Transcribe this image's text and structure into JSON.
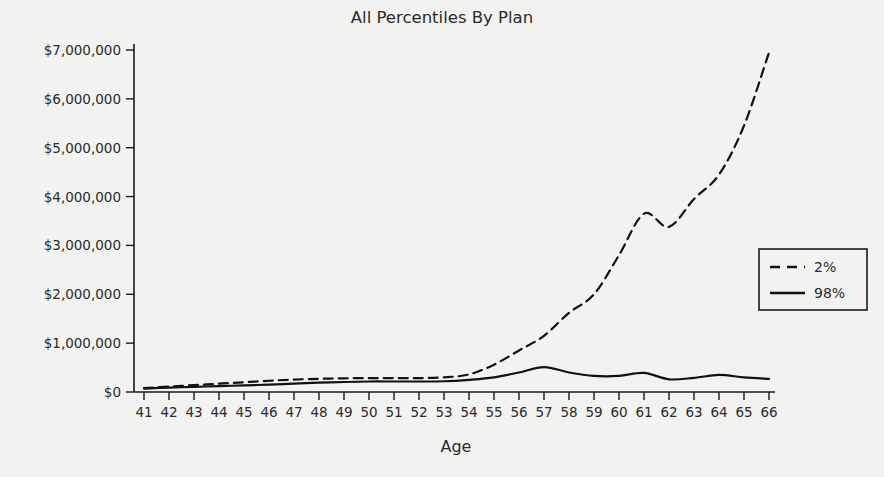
{
  "chart_data": {
    "type": "line",
    "title": "All Percentiles By Plan",
    "xlabel": "Age",
    "ylabel": "",
    "grid": false,
    "legend_position": "right",
    "x": [
      41,
      42,
      43,
      44,
      45,
      46,
      47,
      48,
      49,
      50,
      51,
      52,
      53,
      54,
      55,
      56,
      57,
      58,
      59,
      60,
      61,
      62,
      63,
      64,
      65,
      66
    ],
    "categories": [
      "41",
      "42",
      "43",
      "44",
      "45",
      "46",
      "47",
      "48",
      "49",
      "50",
      "51",
      "52",
      "53",
      "54",
      "55",
      "56",
      "57",
      "58",
      "59",
      "60",
      "61",
      "62",
      "63",
      "64",
      "65",
      "66"
    ],
    "xlim": [
      41,
      66
    ],
    "ylim": [
      0,
      7000000
    ],
    "ytick_values": [
      0,
      1000000,
      2000000,
      3000000,
      4000000,
      5000000,
      6000000,
      7000000
    ],
    "ytick_labels": [
      "$0",
      "$1,000,000",
      "$2,000,000",
      "$3,000,000",
      "$4,000,000",
      "$5,000,000",
      "$6,000,000",
      "$7,000,000"
    ],
    "series": [
      {
        "name": "2%",
        "style": "dashed",
        "color": "#111111",
        "values": [
          80000,
          110000,
          140000,
          170000,
          200000,
          230000,
          255000,
          270000,
          280000,
          285000,
          285000,
          285000,
          300000,
          360000,
          560000,
          850000,
          1150000,
          1620000,
          2000000,
          2800000,
          3650000,
          3380000,
          3950000,
          4450000,
          5450000,
          6950000
        ]
      },
      {
        "name": "98%",
        "style": "solid",
        "color": "#111111",
        "values": [
          70000,
          90000,
          105000,
          120000,
          135000,
          150000,
          170000,
          190000,
          205000,
          215000,
          215000,
          215000,
          220000,
          250000,
          300000,
          400000,
          510000,
          400000,
          330000,
          330000,
          390000,
          260000,
          290000,
          350000,
          300000,
          270000
        ]
      }
    ]
  },
  "legend": {
    "items": [
      {
        "label": "2%",
        "style": "dashed"
      },
      {
        "label": "98%",
        "style": "solid"
      }
    ]
  }
}
